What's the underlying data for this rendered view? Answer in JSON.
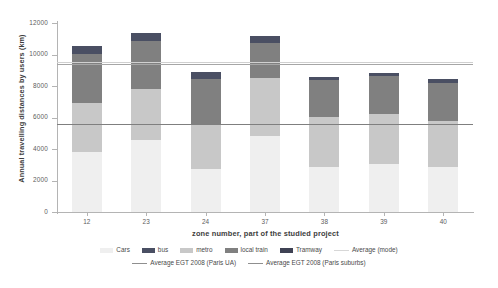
{
  "chart_data": {
    "type": "bar",
    "title": "",
    "subtitle": "",
    "xlabel": "zone number, part of the studied project",
    "ylabel": "Annual travelling distances by users (km)",
    "categories": [
      "12",
      "23",
      "24",
      "37",
      "38",
      "39",
      "40"
    ],
    "ylim": [
      0,
      12000
    ],
    "yticks": [
      0,
      2000,
      4000,
      6000,
      8000,
      10000,
      12000
    ],
    "ytick_labels": [
      "0",
      "2000",
      "4000",
      "6000",
      "8000",
      "10000",
      "12000"
    ],
    "grid": false,
    "legend_position": "bottom",
    "stacked": true,
    "stack_order_bottom_to_top": [
      "Cars",
      "bus",
      "metro",
      "local train",
      "Tramway"
    ],
    "series": [
      {
        "name": "Cars",
        "color": "#efefef",
        "values": [
          3800,
          4550,
          2700,
          4800,
          2850,
          3050,
          2850
        ]
      },
      {
        "name": "bus",
        "color": "#e8e8e8",
        "values": [
          0,
          0,
          0,
          0,
          0,
          0,
          0
        ]
      },
      {
        "name": "metro",
        "color": "#c8c8c8",
        "values": [
          3100,
          3250,
          2900,
          3700,
          3200,
          3200,
          2950
        ]
      },
      {
        "name": "local train",
        "color": "#808080",
        "values": [
          3150,
          3050,
          2850,
          2250,
          2350,
          2400,
          2400
        ]
      },
      {
        "name": "Tramway",
        "color": "#4a4f63",
        "values": [
          500,
          500,
          450,
          450,
          200,
          200,
          250
        ]
      }
    ],
    "totals": [
      10550,
      11350,
      8450,
      11150,
      8600,
      8850,
      8450
    ],
    "reference_lines": [
      {
        "name": "Average (mode)",
        "color": "#d0d0d0",
        "value": 9500
      },
      {
        "name": "Average EGT 2008 (Paris UA)",
        "color": "#a6a6a6",
        "value": 9400
      },
      {
        "name": "Average EGT 2008 (Paris suburbs)",
        "color": "#7f7f7f",
        "value": 5600
      }
    ],
    "legend": [
      {
        "label": "Cars",
        "color": "#efefef",
        "marker": "box"
      },
      {
        "label": "bus",
        "color": "#4a4f63",
        "marker": "box"
      },
      {
        "label": "metro",
        "color": "#c8c8c8",
        "marker": "box"
      },
      {
        "label": "local train",
        "color": "#808080",
        "marker": "box"
      },
      {
        "label": "Tramway",
        "color": "#3f4254",
        "marker": "box"
      },
      {
        "label": "Average (mode)",
        "color": "#d7d7d7",
        "marker": "line"
      },
      {
        "label": "Average EGT 2008 (Paris UA)",
        "color": "#8f8f8f",
        "marker": "line"
      },
      {
        "label": "Average EGT 2008 (Paris suburbs)",
        "color": "#8f8f8f",
        "marker": "line"
      }
    ]
  }
}
